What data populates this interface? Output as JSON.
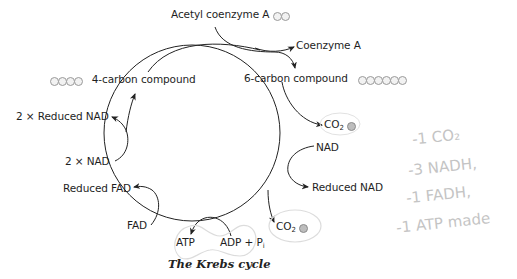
{
  "diagram": {
    "caption": "The Krebs cycle",
    "inputs": {
      "acetyl_coa": {
        "label": "Acetyl coenzyme A",
        "atoms": 2
      },
      "coenzyme_a": {
        "label": "Coenzyme A"
      }
    },
    "compounds": {
      "six_carbon": {
        "label": "6-carbon compound",
        "atoms": 6
      },
      "four_carbon": {
        "label": "4-carbon compound",
        "atoms": 4
      }
    },
    "right_side": {
      "co2_top": {
        "label": "CO",
        "subscript": "2",
        "atoms": 1
      },
      "nad": {
        "label": "NAD"
      },
      "reduced_nad": {
        "label": "Reduced NAD"
      },
      "co2_bottom": {
        "label": "CO",
        "subscript": "2",
        "atoms": 1
      }
    },
    "bottom": {
      "atp": {
        "label": "ATP"
      },
      "adp": {
        "label": "ADP + P",
        "subscript": "i"
      }
    },
    "left_side": {
      "fad": {
        "label": "FAD"
      },
      "reduced_fad": {
        "label": "Reduced FAD"
      },
      "two_nad": {
        "label": "2 × NAD"
      },
      "two_reduced_nad": {
        "label": "2 × Reduced NAD"
      }
    },
    "colors": {
      "line": "#222222",
      "text": "#1e1e1e",
      "atom_fill": "#f2f2f2",
      "atom_stroke": "#9a9a9a",
      "pencil": "#c4c4c4"
    }
  },
  "handwritten_notes": [
    "-1 CO₂",
    "-3 NADH,",
    "-1 FADH,",
    "-1 ATP made"
  ]
}
